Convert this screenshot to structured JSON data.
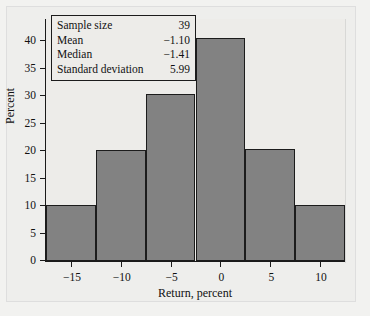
{
  "chart_data": {
    "type": "bar",
    "title": "",
    "subtitle": "",
    "xlabel": "Return, percent",
    "ylabel": "Percent",
    "grid": false,
    "legend": "none",
    "bin_width": 5,
    "bin_edges": [
      -17.5,
      -12.5,
      -7.5,
      -2.5,
      2.5,
      7.5,
      12.5
    ],
    "categories": [
      "-17.5 to -12.5",
      "-12.5 to -7.5",
      "-7.5 to -2.5",
      "-2.5 to 2.5",
      "2.5 to 7.5",
      "7.5 to 12.5"
    ],
    "x": [
      -15,
      -10,
      -5,
      0,
      5,
      10
    ],
    "values": [
      10.2,
      20.2,
      30.4,
      40.5,
      20.4,
      10.2
    ],
    "xlim": [
      -17.5,
      12.5
    ],
    "ylim": [
      0,
      44
    ],
    "xticks": [
      -15,
      -10,
      -5,
      0,
      5,
      10
    ],
    "xtick_labels": [
      "−15",
      "−10",
      "−5",
      "0",
      "5",
      "10"
    ],
    "yticks": [
      0,
      5,
      10,
      15,
      20,
      25,
      30,
      35,
      40
    ],
    "ytick_labels": [
      "0",
      "5",
      "10",
      "15",
      "20",
      "25",
      "30",
      "35",
      "40"
    ],
    "bar_color": "#828282",
    "bar_edge_color": "#1c1c1c",
    "plot_background": "#edece9",
    "annotations": {
      "stats_box": {
        "rows": [
          {
            "label": "Sample size",
            "value": "39"
          },
          {
            "label": "Mean",
            "value": "−1.10"
          },
          {
            "label": "Median",
            "value": "−1.41"
          },
          {
            "label": "Standard deviation",
            "value": "5.99"
          }
        ]
      }
    }
  }
}
